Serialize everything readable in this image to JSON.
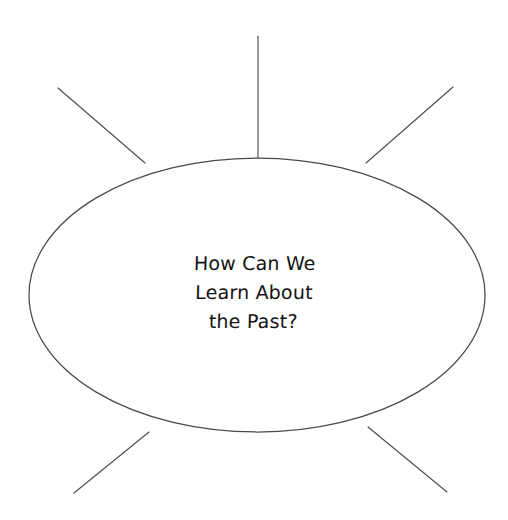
{
  "page": {
    "title": "How Can We Learn About the Past?",
    "background_color": "#ffffff",
    "width": 508,
    "height": 520,
    "type": "concept-web-graphic-organizer"
  },
  "bubble": {
    "name": "central-idea-ellipse",
    "center_x": 257,
    "center_y": 295,
    "radius_x": 228,
    "radius_y": 137,
    "stroke_color": "#4a4a4a",
    "fill_color": "#ffffff",
    "stroke_width": 1.25
  },
  "center_text": {
    "lines": [
      "How Can We",
      "Learn About",
      "the Past?"
    ],
    "color": "#141414",
    "font_size_px": 19,
    "line_height_px": 29,
    "align": "center"
  },
  "rays": {
    "stroke_color": "#4d4d4d",
    "stroke_width": 1.15,
    "count": 5,
    "items": [
      {
        "name": "ray-top",
        "direction": "top",
        "x1": 258,
        "y1": 36,
        "x2": 258,
        "y2": 158
      },
      {
        "name": "ray-top-left",
        "direction": "top-left",
        "x1": 58,
        "y1": 88,
        "x2": 145,
        "y2": 163
      },
      {
        "name": "ray-top-right",
        "direction": "top-right",
        "x1": 453,
        "y1": 87,
        "x2": 366,
        "y2": 163
      },
      {
        "name": "ray-bottom-left",
        "direction": "bottom-left",
        "x1": 74,
        "y1": 493,
        "x2": 149,
        "y2": 432
      },
      {
        "name": "ray-bottom-right",
        "direction": "bottom-right",
        "x1": 447,
        "y1": 492,
        "x2": 368,
        "y2": 427
      }
    ]
  }
}
